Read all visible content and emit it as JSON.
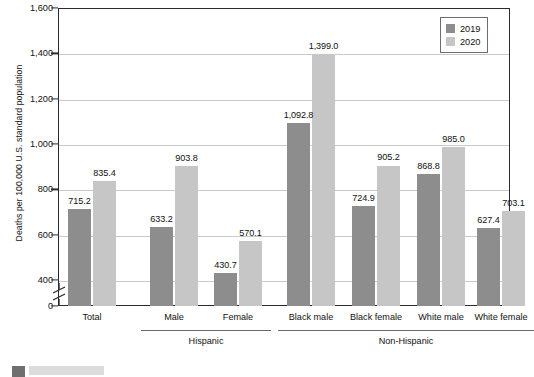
{
  "chart_data": {
    "type": "bar",
    "title": "",
    "xlabel": "",
    "ylabel": "Deaths per 100,000 U.S. standard population",
    "ylim": [
      0,
      1600
    ],
    "yticks": [
      "0",
      "400",
      "600",
      "800",
      "1,000",
      "1,200",
      "1,400",
      "1,600"
    ],
    "ytick_values": [
      0,
      400,
      600,
      800,
      1000,
      1200,
      1400,
      1600
    ],
    "axis_break": true,
    "axis_break_between": [
      0,
      400
    ],
    "grid": true,
    "legend_position": "top-right",
    "categories": [
      "Total",
      "Male",
      "Female",
      "Black male",
      "Black female",
      "White male",
      "White female"
    ],
    "series": [
      {
        "name": "2019",
        "color": "#8d8d8d",
        "values": [
          715.2,
          633.2,
          430.7,
          1092.8,
          724.9,
          868.8,
          627.4
        ],
        "labels": [
          "715.2",
          "633.2",
          "430.7",
          "1,092.8",
          "724.9",
          "868.8",
          "627.4"
        ]
      },
      {
        "name": "2020",
        "color": "#c6c6c6",
        "values": [
          835.4,
          903.8,
          570.1,
          1399.0,
          905.2,
          985.0,
          703.1
        ],
        "labels": [
          "835.4",
          "903.8",
          "570.1",
          "1,399.0",
          "905.2",
          "985.0",
          "703.1"
        ]
      }
    ],
    "groups": [
      {
        "label": "Hispanic",
        "categories": [
          "Male",
          "Female"
        ]
      },
      {
        "label": "Non-Hispanic",
        "categories": [
          "Black male",
          "Black female",
          "White male",
          "White female"
        ]
      }
    ]
  },
  "legend": {
    "items": [
      {
        "label": "2019",
        "color": "#8d8d8d"
      },
      {
        "label": "2020",
        "color": "#c6c6c6"
      }
    ]
  },
  "colors": {
    "series_2019": "#8d8d8d",
    "series_2020": "#c6c6c6",
    "axis": "#2b2b2b",
    "gridline": "#c9c9c9",
    "text": "#111111"
  }
}
